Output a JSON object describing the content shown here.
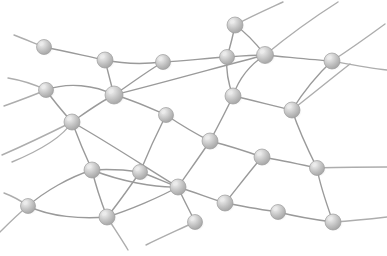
{
  "figure": {
    "width": 387,
    "height": 256,
    "background_color": "#ffffff",
    "node_count": 25,
    "edge_count": 41
  },
  "style": {
    "edge_color": "#9a9a9a",
    "edge_color_light": "#adadad",
    "edge_width": 1.4,
    "node_fill_dark": "#a8a8a8",
    "node_fill_mid": "#c4c4c4",
    "node_fill_light": "#ebebeb",
    "node_stroke": "#9e9e9e",
    "node_radius": 7.5,
    "shadow_color": "#d8d8d8"
  },
  "nodes": [
    {
      "id": "n1",
      "x": 44,
      "y": 47,
      "r": 7.5
    },
    {
      "id": "n2",
      "x": 105,
      "y": 60,
      "r": 8.0
    },
    {
      "id": "n3",
      "x": 163,
      "y": 62,
      "r": 7.5
    },
    {
      "id": "n4",
      "x": 227,
      "y": 57,
      "r": 7.5
    },
    {
      "id": "n5",
      "x": 265,
      "y": 55,
      "r": 8.5
    },
    {
      "id": "n6",
      "x": 235,
      "y": 25,
      "r": 8.0
    },
    {
      "id": "n7",
      "x": 332,
      "y": 61,
      "r": 8.0
    },
    {
      "id": "n8",
      "x": 46,
      "y": 90,
      "r": 7.5
    },
    {
      "id": "n9",
      "x": 114,
      "y": 95,
      "r": 9.0
    },
    {
      "id": "n10",
      "x": 72,
      "y": 122,
      "r": 8.0
    },
    {
      "id": "n11",
      "x": 166,
      "y": 115,
      "r": 7.5
    },
    {
      "id": "n12",
      "x": 233,
      "y": 96,
      "r": 8.0
    },
    {
      "id": "n13",
      "x": 292,
      "y": 110,
      "r": 8.0
    },
    {
      "id": "n14",
      "x": 210,
      "y": 141,
      "r": 8.0
    },
    {
      "id": "n15",
      "x": 262,
      "y": 157,
      "r": 8.0
    },
    {
      "id": "n16",
      "x": 92,
      "y": 170,
      "r": 8.0
    },
    {
      "id": "n17",
      "x": 140,
      "y": 172,
      "r": 7.5
    },
    {
      "id": "n18",
      "x": 178,
      "y": 187,
      "r": 8.0
    },
    {
      "id": "n19",
      "x": 317,
      "y": 168,
      "r": 7.5
    },
    {
      "id": "n20",
      "x": 28,
      "y": 206,
      "r": 7.5
    },
    {
      "id": "n21",
      "x": 107,
      "y": 217,
      "r": 8.0
    },
    {
      "id": "n22",
      "x": 225,
      "y": 203,
      "r": 8.0
    },
    {
      "id": "n23",
      "x": 195,
      "y": 222,
      "r": 7.5
    },
    {
      "id": "n24",
      "x": 278,
      "y": 212,
      "r": 7.5
    },
    {
      "id": "n25",
      "x": 333,
      "y": 222,
      "r": 8.0
    }
  ],
  "edges": [
    {
      "from": "n1",
      "to": "n2",
      "d": "M44,47 C64,51 86,56 105,60"
    },
    {
      "from": "n2",
      "to": "n3",
      "d": "M105,60 C124,64 146,64 163,62"
    },
    {
      "from": "n3",
      "to": "n4",
      "d": "M163,62 C184,61 208,58 227,57"
    },
    {
      "from": "n4",
      "to": "n5",
      "d": "M227,57 C240,56 254,55 265,55"
    },
    {
      "from": "n5",
      "to": "n7",
      "d": "M265,55 C288,57 312,60 332,61"
    },
    {
      "from": "n6",
      "to": "n4",
      "d": "M235,25 C233,36 230,47 227,57"
    },
    {
      "from": "n2",
      "to": "n9",
      "d": "M105,60 C108,72 111,84 114,95"
    },
    {
      "from": "n8",
      "to": "n9",
      "d": "M46,90 C68,82 95,85 114,95"
    },
    {
      "from": "n8",
      "to": "n10",
      "d": "M46,90 C53,100 63,112 72,122"
    },
    {
      "from": "n9",
      "to": "n10",
      "d": "M114,95 C100,102 85,113 72,122"
    },
    {
      "from": "n9",
      "to": "n11",
      "d": "M114,95 C131,99 150,108 166,115"
    },
    {
      "from": "n3",
      "to": "n9",
      "d": "M163,62 C146,72 129,85 114,95"
    },
    {
      "from": "n11",
      "to": "n14",
      "d": "M166,115 C178,123 196,134 210,141"
    },
    {
      "from": "n11",
      "to": "n17",
      "d": "M166,115 C157,133 147,155 140,172"
    },
    {
      "from": "n12",
      "to": "n4",
      "d": "M233,96 C228,83 226,69 227,57"
    },
    {
      "from": "n12",
      "to": "n13",
      "d": "M233,96 C252,100 274,106 292,110"
    },
    {
      "from": "n12",
      "to": "n14",
      "d": "M233,96 C226,111 217,128 210,141"
    },
    {
      "from": "n13",
      "to": "n7",
      "d": "M292,110 C302,94 318,74 332,61"
    },
    {
      "from": "n13",
      "to": "n19",
      "d": "M292,110 C298,128 309,152 317,168"
    },
    {
      "from": "n14",
      "to": "n15",
      "d": "M210,141 C230,146 248,152 262,157"
    },
    {
      "from": "n14",
      "to": "n18",
      "d": "M210,141 C200,156 187,174 178,187"
    },
    {
      "from": "n15",
      "to": "n19",
      "d": "M262,157 C280,160 303,165 317,168"
    },
    {
      "from": "n15",
      "to": "n22",
      "d": "M262,157 C250,171 234,192 225,203"
    },
    {
      "from": "n16",
      "to": "n17",
      "d": "M92,170 C107,169 126,170 140,172"
    },
    {
      "from": "n16",
      "to": "n20",
      "d": "M92,170 C70,177 45,191 28,206"
    },
    {
      "from": "n16",
      "to": "n21",
      "d": "M92,170 C96,187 102,204 107,217"
    },
    {
      "from": "n17",
      "to": "n18",
      "d": "M140,172 C152,176 167,183 178,187"
    },
    {
      "from": "n18",
      "to": "n22",
      "d": "M178,187 C194,192 212,199 225,203"
    },
    {
      "from": "n18",
      "to": "n23",
      "d": "M178,187 C183,199 191,213 195,222"
    },
    {
      "from": "n20",
      "to": "n21",
      "d": "M28,206 C50,217 82,219 107,217"
    },
    {
      "from": "n22",
      "to": "n24",
      "d": "M225,203 C241,206 263,210 278,212"
    },
    {
      "from": "n24",
      "to": "n25",
      "d": "M278,212 C294,216 317,220 333,222"
    },
    {
      "from": "n19",
      "to": "n25",
      "d": "M317,168 C320,186 328,208 333,222"
    },
    {
      "from": "n10",
      "to": "n16",
      "d": "M72,122 C78,138 86,157 92,170"
    },
    {
      "from": "n9",
      "to": "n5",
      "d": "M114,95 C166,82 226,65 265,55"
    },
    {
      "from": "n10",
      "to": "n18",
      "d": "M72,122 C106,141 150,170 178,187"
    },
    {
      "from": "n17",
      "to": "n21",
      "d": "M140,172 C129,188 116,206 107,217"
    },
    {
      "from": "n16",
      "to": "n18",
      "d": "M92,170 C120,181 155,188 178,187"
    },
    {
      "from": "n21",
      "to": "n18",
      "d": "M107,217 C130,210 160,197 178,187"
    },
    {
      "from": "n5",
      "to": "n12",
      "d": "M265,55 C248,66 238,81 233,96"
    },
    {
      "from": "n6",
      "to": "n5",
      "d": "M235,25 C248,34 258,46 265,55"
    }
  ],
  "open_edges": [
    {
      "id": "e1",
      "d": "M44,47 C34,43 22,38 14,35",
      "note": "stub up-left from n1"
    },
    {
      "id": "e2",
      "d": "M46,90 C34,84 20,80 8,78",
      "note": "stub up-left from n8"
    },
    {
      "id": "e3",
      "d": "M46,90 C34,95 18,101 4,106",
      "note": "stub down-left from n8"
    },
    {
      "id": "e4",
      "d": "M72,122 C52,132 25,145 2,155",
      "note": "stub down-left from n10"
    },
    {
      "id": "e5",
      "d": "M28,206 C18,214 8,224 0,232",
      "note": "stub down-left from n20"
    },
    {
      "id": "e6",
      "d": "M28,206 C20,200 12,196 4,193",
      "note": "stub up-left from n20"
    },
    {
      "id": "e7",
      "d": "M107,217 C114,228 122,240 128,250",
      "note": "stub down from n21"
    },
    {
      "id": "e8",
      "d": "M195,222 C178,230 160,238 146,245",
      "note": "stub down-left from n23"
    },
    {
      "id": "e9",
      "d": "M235,25 C252,16 270,8 283,2",
      "note": "stub up-right from n6"
    },
    {
      "id": "e10",
      "d": "M265,55 C288,36 316,16 338,2",
      "note": "stub up-right from n5"
    },
    {
      "id": "e11",
      "d": "M332,61 C352,48 370,35 385,24",
      "note": "stub up-right from n7"
    },
    {
      "id": "e12",
      "d": "M332,61 C348,64 368,68 387,70",
      "note": "stub right from n7"
    },
    {
      "id": "e13",
      "d": "M317,168 C336,167 362,167 387,167",
      "note": "stub right from n19"
    },
    {
      "id": "e14",
      "d": "M333,222 C350,221 370,219 387,217",
      "note": "stub right from n25"
    },
    {
      "id": "e15",
      "d": "M292,110 C310,96 332,78 350,64",
      "note": "upper-right curve past n13"
    },
    {
      "id": "e16",
      "d": "M12,162 C36,152 62,138 72,122",
      "note": "left inflow to n10"
    }
  ]
}
